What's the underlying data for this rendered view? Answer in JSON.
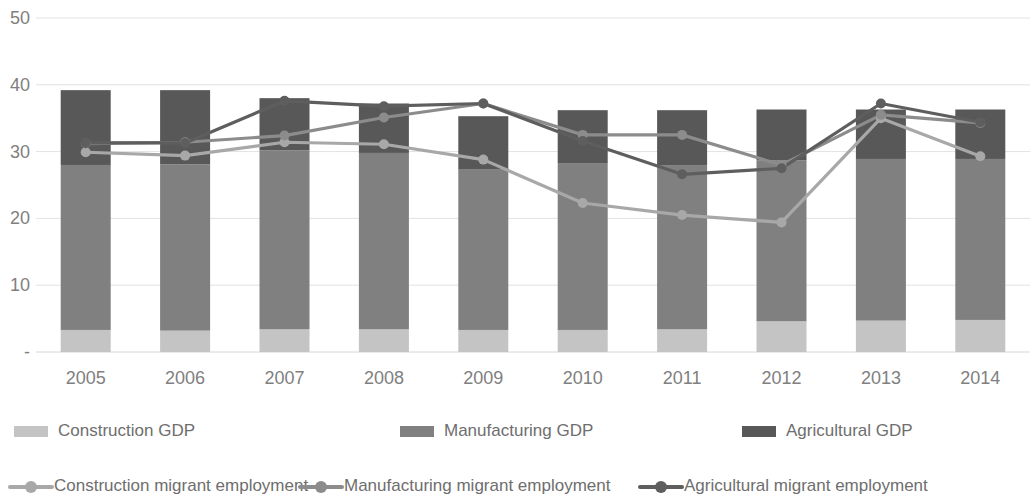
{
  "chart_data": {
    "type": "bar",
    "title": "",
    "subtitle": "",
    "xlabel": "",
    "ylabel": "",
    "categories": [
      "2005",
      "2006",
      "2007",
      "2008",
      "2009",
      "2010",
      "2011",
      "2012",
      "2013",
      "2014"
    ],
    "ylim": [
      0,
      50
    ],
    "yticks": [
      0,
      10,
      20,
      30,
      40,
      50
    ],
    "ytick_labels": [
      "-",
      "10",
      "20",
      "30",
      "40",
      "50"
    ],
    "grid": true,
    "legend_position": "bottom",
    "stacked": true,
    "bar_series": [
      {
        "name": "Construction GDP",
        "color": "#c4c4c4",
        "values": [
          3.3,
          3.2,
          3.4,
          3.4,
          3.3,
          3.3,
          3.4,
          4.6,
          4.7,
          4.8
        ]
      },
      {
        "name": "Manufacturing GDP",
        "color": "#808080",
        "values": [
          24.7,
          24.9,
          26.8,
          26.4,
          24.0,
          24.9,
          24.5,
          24.1,
          24.2,
          24.1
        ]
      },
      {
        "name": "Agricultural GDP",
        "color": "#585858",
        "values": [
          11.2,
          11.1,
          7.8,
          7.4,
          8.0,
          8.0,
          8.3,
          7.6,
          7.4,
          7.4
        ]
      }
    ],
    "bar_totals": [
      39.2,
      39.2,
      38.0,
      37.2,
      35.3,
      36.2,
      36.2,
      36.3,
      36.3,
      36.3
    ],
    "line_series": [
      {
        "name": "Construction migrant employment",
        "color": "#a8a8a8",
        "values": [
          29.9,
          29.4,
          31.4,
          31.1,
          28.8,
          22.3,
          20.5,
          19.4,
          35.0,
          29.3
        ]
      },
      {
        "name": "Manufacturing migrant employment",
        "color": "#8c8c8c",
        "values": [
          31.2,
          31.4,
          32.4,
          35.1,
          37.2,
          32.5,
          32.5,
          28.0,
          35.5,
          34.3
        ]
      },
      {
        "name": "Agricultural migrant employment",
        "color": "#5e5e5e",
        "values": [
          31.3,
          31.3,
          37.6,
          36.8,
          37.2,
          31.6,
          26.6,
          27.5,
          37.2,
          34.4
        ]
      }
    ]
  },
  "legend": {
    "row1": [
      {
        "label": "Construction GDP",
        "marker": "swatch",
        "color": "#c4c4c4"
      },
      {
        "label": "Manufacturing GDP",
        "marker": "swatch",
        "color": "#808080"
      },
      {
        "label": "Agricultural GDP",
        "marker": "swatch",
        "color": "#585858"
      }
    ],
    "row2": [
      {
        "label": "Construction migrant employment",
        "marker": "line-marker",
        "color": "#a8a8a8"
      },
      {
        "label": "Manufacturing migrant employment",
        "marker": "line-marker",
        "color": "#8c8c8c"
      },
      {
        "label": "Agricultural migrant employment",
        "marker": "line-marker",
        "color": "#5e5e5e"
      }
    ]
  },
  "colors": {
    "grid": "#e2e2e2",
    "axis": "#d6d6d6",
    "tick_text": "#808080",
    "legend_text": "#6e6e6e",
    "background": "#ffffff"
  }
}
